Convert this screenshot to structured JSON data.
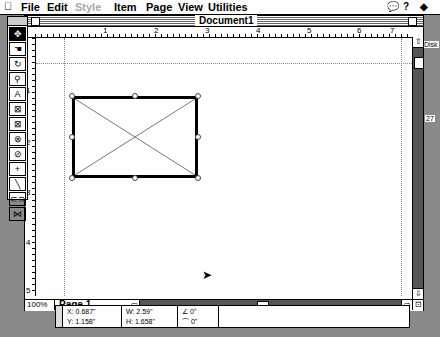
{
  "menubar": {
    "apple": "",
    "items": [
      "File",
      "Edit",
      "Style",
      "Item",
      "Page",
      "View",
      "Utilities"
    ],
    "disabled": [
      "Style"
    ],
    "right_icons": [
      "balloon-help-icon",
      "help-icon",
      "application-menu-icon"
    ]
  },
  "desktop": {
    "disk_label": "Disk",
    "side_label": "27"
  },
  "toolbox": {
    "tools": [
      "item-tool",
      "content-tool",
      "rotate-tool",
      "zoom-tool",
      "text-box-tool",
      "rectangle-picture-box-tool",
      "rounded-picture-box-tool",
      "oval-picture-box-tool",
      "polygon-picture-box-tool",
      "orthogonal-line-tool",
      "line-tool",
      "linking-tool",
      "unlinking-tool"
    ],
    "glyphs": [
      "✥",
      "☚",
      "↻",
      "🔍",
      "A",
      "⊠",
      "⊠",
      "⊗",
      "⊘",
      "+",
      "╲",
      "⊂⊃",
      "⋈"
    ],
    "selected": 0
  },
  "window": {
    "title": "Document1",
    "hruler_labels": [
      "1",
      "2",
      "3",
      "4",
      "5",
      "6",
      "7"
    ],
    "vruler_labels": [
      "1",
      "2",
      "3",
      "4",
      "5"
    ],
    "zoom": "100%",
    "page": "Page 1"
  },
  "measurements": {
    "x": "X: 0.687\"",
    "y": "Y: 1.158\"",
    "w": "W: 2.59\"",
    "h": "H: 1.658\"",
    "angle": "0°",
    "corner": "0\""
  }
}
